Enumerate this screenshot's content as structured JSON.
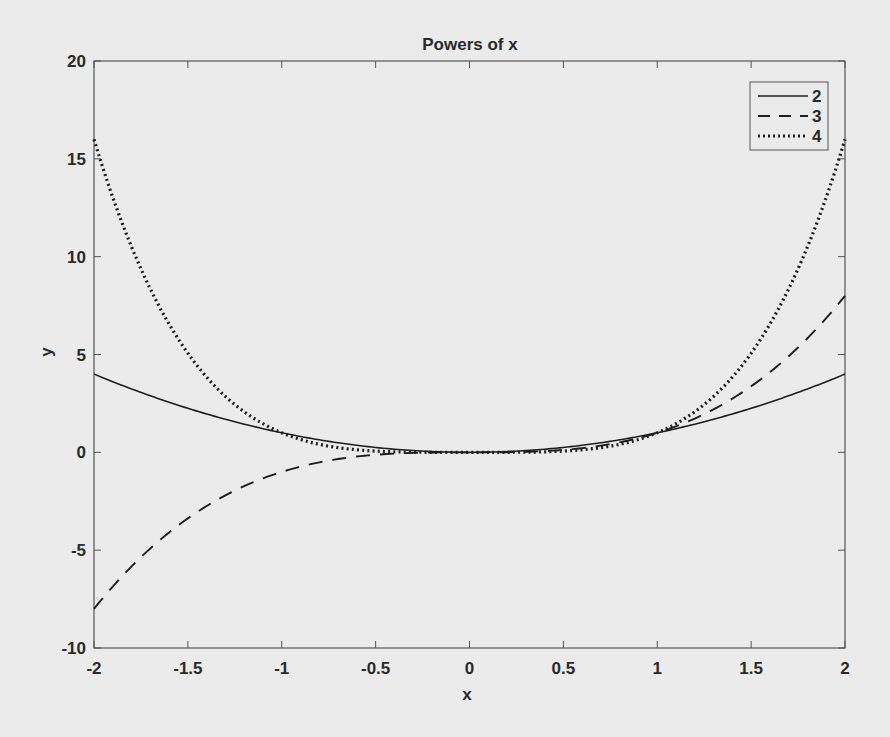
{
  "chart_data": {
    "type": "line",
    "title": "Powers of x",
    "xlabel": "x",
    "ylabel": "y",
    "xlim": [
      -2,
      2
    ],
    "ylim": [
      -10,
      20
    ],
    "xticks": [
      -2,
      -1.5,
      -1,
      -0.5,
      0,
      0.5,
      1,
      1.5,
      2
    ],
    "xtick_labels": [
      "-2",
      "-1.5",
      "-1",
      "-0.5",
      "0",
      "0.5",
      "1",
      "1.5",
      "2"
    ],
    "yticks": [
      -10,
      -5,
      0,
      5,
      10,
      15,
      20
    ],
    "ytick_labels": [
      "-10",
      "-5",
      "0",
      "5",
      "10",
      "15",
      "20"
    ],
    "grid": false,
    "legend_position": "upper right",
    "x": [
      -2,
      -1.5,
      -1,
      -0.5,
      0,
      0.5,
      1,
      1.5,
      2
    ],
    "series": [
      {
        "name": "2",
        "style": "solid",
        "expr": "x^2",
        "values": [
          4,
          2.25,
          1,
          0.25,
          0,
          0.25,
          1,
          2.25,
          4
        ]
      },
      {
        "name": "3",
        "style": "dashed",
        "expr": "x^3",
        "values": [
          -8,
          -3.375,
          -1,
          -0.125,
          0,
          0.125,
          1,
          3.375,
          8
        ]
      },
      {
        "name": "4",
        "style": "dotted",
        "expr": "x^4",
        "values": [
          16,
          5.0625,
          1,
          0.0625,
          0,
          0.0625,
          1,
          5.0625,
          16
        ]
      }
    ]
  },
  "legend": {
    "items": [
      {
        "label": "2",
        "style": "solid"
      },
      {
        "label": "3",
        "style": "dashed"
      },
      {
        "label": "4",
        "style": "dotted"
      }
    ]
  },
  "colors": {
    "background": "#ebebeb",
    "ink": "#1e1e1e",
    "axis": "#555555"
  }
}
